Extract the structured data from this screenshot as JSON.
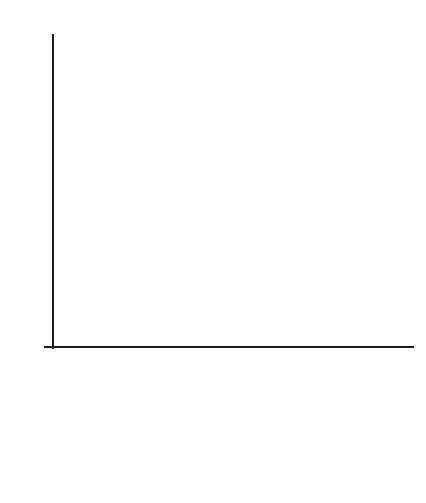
{
  "chart_data": {
    "type": "bar",
    "title": "",
    "xlabel": "Score",
    "ylabel": "",
    "categories": [
      "150–179",
      "180–199",
      "200–249",
      "250+"
    ],
    "values": [
      5,
      4.05,
      9.1,
      2.1
    ],
    "ylim": [
      0,
      10.4
    ],
    "ytick_labels": [
      "0",
      "1",
      "2",
      "3",
      "4",
      "5",
      "6",
      "7",
      "8",
      "9",
      "10"
    ],
    "ytick_values": [
      0,
      1,
      2,
      3,
      4,
      5,
      6,
      7,
      8,
      9,
      10
    ],
    "grid": true,
    "legend": "none",
    "bar_colors": [
      "#b0b0b0",
      "#f2f2f2",
      "#b5b5b5",
      "#b0b0b0"
    ],
    "bar_edge_color": "#4a4a4a",
    "grid_color": "#d9d9d9",
    "axis_color": "#1c1c1c",
    "background": "#ffffff"
  },
  "axes": {
    "y_ticks": [
      {
        "label": "10",
        "value": 10
      },
      {
        "label": "9",
        "value": 9
      },
      {
        "label": "8",
        "value": 8
      },
      {
        "label": "7",
        "value": 7
      },
      {
        "label": "6",
        "value": 6
      },
      {
        "label": "5",
        "value": 5
      },
      {
        "label": "4",
        "value": 4
      },
      {
        "label": "3",
        "value": 3
      },
      {
        "label": "2",
        "value": 2
      },
      {
        "label": "1",
        "value": 1
      },
      {
        "label": "0",
        "value": 0
      }
    ],
    "x_title": "Score",
    "x_labels": [
      "150–179",
      "180–199",
      "200–249",
      "250+"
    ]
  },
  "header": {
    "clipped_title": ""
  }
}
